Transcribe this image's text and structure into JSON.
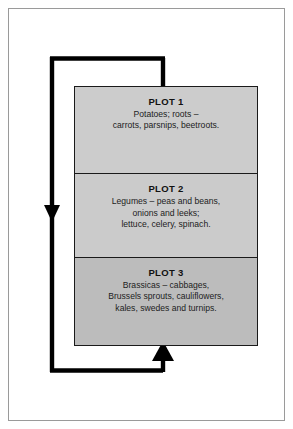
{
  "diagram": {
    "type": "crop-rotation-cycle",
    "title_visible": false,
    "colors": {
      "plot1_fill": "#cccccc",
      "plot2_fill": "#cbcbcb",
      "plot3_fill": "#bcbcbc",
      "box_stroke": "#1a1a1a",
      "loop_stroke": "#000000",
      "page_border": "#9a9a9a",
      "background": "#ffffff"
    },
    "plots": [
      {
        "id": "plot-1",
        "title": "PLOT 1",
        "description": "Potatoes; roots –\ncarrots, parsnips, beetroots."
      },
      {
        "id": "plot-2",
        "title": "PLOT 2",
        "description": "Legumes – peas and beans,\nonions and leeks;\nlettuce, celery, spinach."
      },
      {
        "id": "plot-3",
        "title": "PLOT 3",
        "description": "Brassicas – cabbages,\nBrussels sprouts, cauliflowers,\nkales, swedes and turnips."
      }
    ],
    "arrows": [
      {
        "id": "arrow-plot3-to-plot2",
        "direction": "up",
        "from": "plot-3",
        "to": "plot-2"
      },
      {
        "id": "arrow-plot2-to-plot1",
        "direction": "up",
        "from": "plot-2",
        "to": "plot-1"
      },
      {
        "id": "arrow-loop-return",
        "direction": "down-then-up",
        "from": "plot-1",
        "to": "plot-3"
      }
    ]
  }
}
